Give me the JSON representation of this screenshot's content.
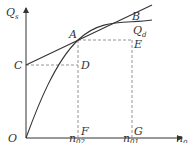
{
  "diagram": {
    "axes": {
      "y_label": "Q",
      "y_label_sub": "s",
      "x_label": "n",
      "x_label_sub": "0",
      "origin": "O"
    },
    "points": {
      "A": "A",
      "B": "B",
      "C": "C",
      "D": "D",
      "E": "E",
      "F": "F",
      "G": "G"
    },
    "curve_label": "Q",
    "curve_label_sub": "d",
    "x_ticks": [
      {
        "label": "n",
        "sub": "02"
      },
      {
        "label": "n",
        "sub": "01"
      }
    ],
    "colors": {
      "line": "#333333",
      "dashed": "#888888"
    }
  }
}
